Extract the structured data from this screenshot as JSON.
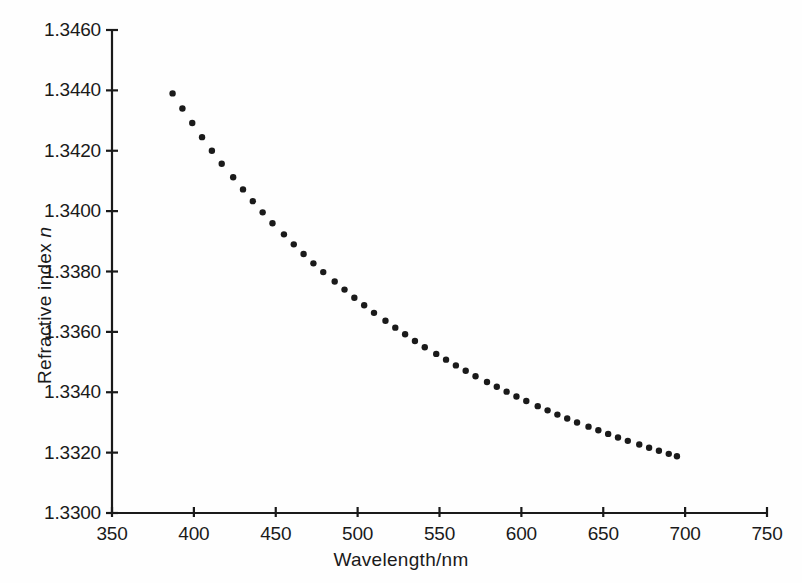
{
  "chart_data": {
    "type": "scatter",
    "title": "",
    "subtitle": "",
    "xlabel": "Wavelength/nm",
    "ylabel": "Refractive index n",
    "ylabel_plain": "Refractive index",
    "ylabel_italic_symbol": "n",
    "xlim": [
      350,
      750
    ],
    "ylim": [
      1.33,
      1.346
    ],
    "xticks": [
      350,
      400,
      450,
      500,
      550,
      600,
      650,
      700,
      750
    ],
    "yticks": [
      1.33,
      1.332,
      1.334,
      1.336,
      1.338,
      1.34,
      1.342,
      1.344,
      1.346
    ],
    "xtick_labels": [
      "350",
      "400",
      "450",
      "500",
      "550",
      "600",
      "650",
      "700",
      "750"
    ],
    "ytick_labels": [
      "1.3300",
      "1.3320",
      "1.3340",
      "1.3360",
      "1.3380",
      "1.3400",
      "1.3420",
      "1.3440",
      "1.3460"
    ],
    "grid": false,
    "legend": null,
    "legend_position": "none",
    "marker": "dot",
    "marker_color": "#1a1a1a",
    "marker_size": 3.2,
    "axis_color": "#1a1a1a",
    "background_color": "#fefefe",
    "series": [
      {
        "name": "Refractive index of water",
        "x": [
          387,
          393,
          399,
          405,
          411,
          417,
          424,
          430,
          436,
          442,
          448,
          455,
          461,
          467,
          473,
          479,
          486,
          492,
          498,
          504,
          510,
          517,
          523,
          529,
          535,
          541,
          548,
          554,
          560,
          566,
          572,
          579,
          585,
          591,
          597,
          603,
          610,
          616,
          622,
          628,
          634,
          641,
          647,
          653,
          659,
          665,
          672,
          678,
          684,
          690,
          695
        ],
        "y": [
          1.3439,
          1.3434,
          1.34292,
          1.34245,
          1.342,
          1.34157,
          1.34112,
          1.34072,
          1.34033,
          1.33996,
          1.3396,
          1.33923,
          1.3389,
          1.33858,
          1.33827,
          1.33798,
          1.33767,
          1.3374,
          1.33713,
          1.33688,
          1.33663,
          1.33637,
          1.33614,
          1.33592,
          1.3357,
          1.33549,
          1.33527,
          1.33508,
          1.33489,
          1.33471,
          1.33453,
          1.33434,
          1.33418,
          1.33402,
          1.33386,
          1.33371,
          1.33354,
          1.3334,
          1.33326,
          1.33313,
          1.333,
          1.33286,
          1.33274,
          1.33262,
          1.3325,
          1.33239,
          1.33227,
          1.33216,
          1.33206,
          1.33196,
          1.33188
        ]
      }
    ]
  }
}
